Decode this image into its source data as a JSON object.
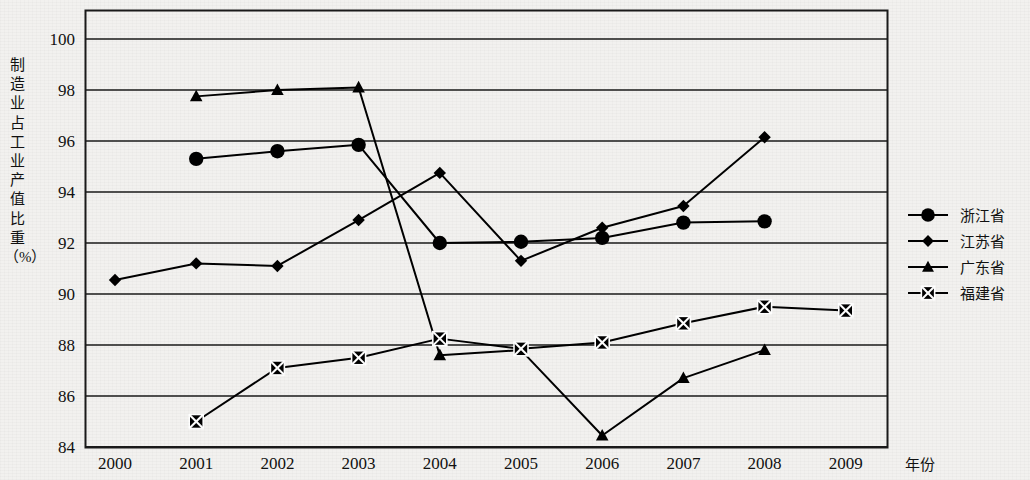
{
  "chart_data": {
    "type": "line",
    "title": "",
    "xlabel": "年份",
    "ylabel": "制造业占工业产值比重（%）",
    "ylabel_chars": [
      "制",
      "造",
      "业",
      "占",
      "工",
      "业",
      "产",
      "值",
      "比",
      "重",
      "（%）"
    ],
    "x": [
      2000,
      2001,
      2002,
      2003,
      2004,
      2005,
      2006,
      2007,
      2008,
      2009
    ],
    "xtick_labels": [
      "2000",
      "2001",
      "2002",
      "2003",
      "2004",
      "2005",
      "2006",
      "2007",
      "2008",
      "2009"
    ],
    "ytick_labels": [
      "84",
      "86",
      "88",
      "90",
      "92",
      "94",
      "96",
      "98",
      "100"
    ],
    "yticks": [
      84,
      86,
      88,
      90,
      92,
      94,
      96,
      98,
      100
    ],
    "ylim": [
      84,
      100
    ],
    "grid": true,
    "grid_axis": "y",
    "legend_position": "right",
    "series": [
      {
        "name": "浙江省",
        "marker": "circle",
        "color": "#000000",
        "values": [
          null,
          95.3,
          95.6,
          95.85,
          92.0,
          92.05,
          92.2,
          92.8,
          92.85,
          null
        ]
      },
      {
        "name": "江苏省",
        "marker": "diamond",
        "color": "#000000",
        "values": [
          90.55,
          91.2,
          91.1,
          92.9,
          94.75,
          91.3,
          92.6,
          93.45,
          96.15,
          null
        ]
      },
      {
        "name": "广东省",
        "marker": "triangle",
        "color": "#000000",
        "values": [
          null,
          97.75,
          98.0,
          98.1,
          87.6,
          87.8,
          84.45,
          86.7,
          87.8,
          null
        ]
      },
      {
        "name": "福建省",
        "marker": "crossed-square",
        "color": "#000000",
        "values": [
          null,
          85.0,
          87.1,
          87.5,
          88.25,
          87.85,
          88.1,
          88.85,
          89.5,
          89.35
        ]
      }
    ]
  }
}
